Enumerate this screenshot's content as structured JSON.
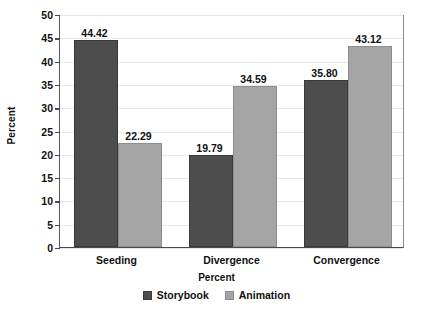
{
  "chart_data": {
    "type": "bar",
    "title": "",
    "subtitle": "",
    "xlabel": "Percent",
    "ylabel": "Percent",
    "categories": [
      "Seeding",
      "Divergence",
      "Convergence"
    ],
    "series": [
      {
        "name": "Storybook",
        "color": "#4d4d4d",
        "values": [
          44.42,
          19.79,
          35.8
        ]
      },
      {
        "name": "Animation",
        "color": "#a5a5a5",
        "values": [
          22.29,
          34.59,
          43.12
        ]
      }
    ],
    "value_labels": [
      [
        "44.42",
        "19.79",
        "35.80"
      ],
      [
        "22.29",
        "34.59",
        "43.12"
      ]
    ],
    "ylim": [
      0,
      50
    ],
    "ytick_values": [
      0,
      5,
      10,
      15,
      20,
      25,
      30,
      35,
      40,
      45,
      50
    ],
    "ytick_labels": [
      "0",
      "5",
      "10",
      "15",
      "20",
      "25",
      "30",
      "35",
      "40",
      "45",
      "50"
    ],
    "grid": true,
    "grid_axis": "y",
    "legend_position": "bottom",
    "background_color": "#ffffff",
    "grid_color": "#e9e9e9",
    "axis_color": "#4a4a4a"
  },
  "legend": {
    "items": [
      {
        "label": "Storybook"
      },
      {
        "label": "Animation"
      }
    ]
  },
  "axes": {
    "y_title": "Percent",
    "x_title": "Percent"
  }
}
